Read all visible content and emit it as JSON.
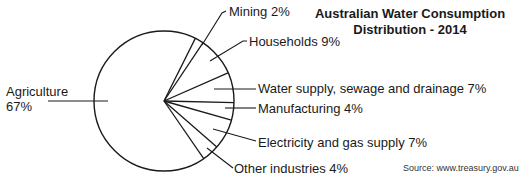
{
  "chart_data": {
    "type": "pie",
    "title": "Australian Water Consumption Distribution - 2014",
    "title_lines": [
      "Australian Water Consumption",
      "Distribution - 2014"
    ],
    "source": "Source: www.treasury.gov.au",
    "unit": "%",
    "categories": [
      "Agriculture",
      "Mining",
      "Households",
      "Water supply, sewage and drainage",
      "Manufacturing",
      "Electricity and gas supply",
      "Other industries"
    ],
    "values": [
      67,
      2,
      9,
      7,
      4,
      7,
      4
    ],
    "labels": [
      {
        "name": "Agriculture",
        "line1": "Agriculture",
        "line2": "67%"
      },
      {
        "name": "Mining",
        "text": "Mining 2%"
      },
      {
        "name": "Households",
        "text": "Households 9%"
      },
      {
        "name": "Water supply, sewage and drainage",
        "text": "Water supply, sewage and drainage 7%"
      },
      {
        "name": "Manufacturing",
        "text": "Manufacturing 4%"
      },
      {
        "name": "Electricity and gas supply",
        "text": "Electricity and gas supply 7%"
      },
      {
        "name": "Other industries",
        "text": "Other industries 4%"
      }
    ],
    "legend": "none (leader-line labels)",
    "colors": {
      "stroke": "#1a1a1a",
      "fill": "#ffffff"
    }
  }
}
